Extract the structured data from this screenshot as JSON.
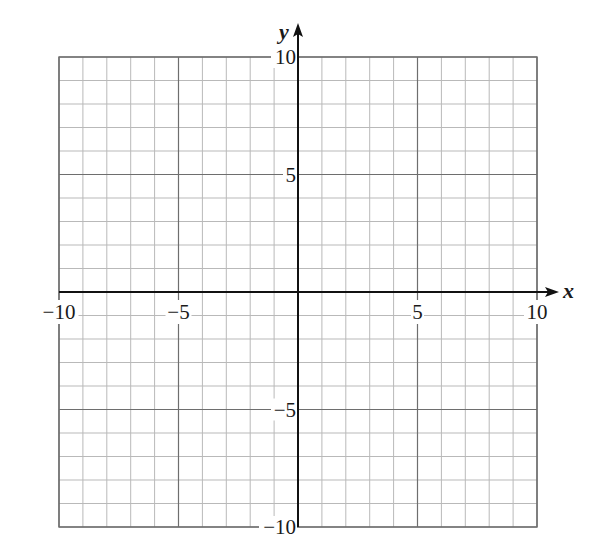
{
  "chart_data": {
    "type": "scatter",
    "title": "",
    "xlabel": "x",
    "ylabel": "y",
    "xlim": [
      -10,
      10
    ],
    "ylim": [
      -10,
      10
    ],
    "grid": true,
    "grid_minor_step": 1,
    "grid_major_step": 5,
    "x_ticks": [
      {
        "value": -10,
        "label": "−10"
      },
      {
        "value": -5,
        "label": "−5"
      },
      {
        "value": 5,
        "label": "5"
      },
      {
        "value": 10,
        "label": "10"
      }
    ],
    "y_ticks": [
      {
        "value": 10,
        "label": "10"
      },
      {
        "value": 5,
        "label": "5"
      },
      {
        "value": -5,
        "label": "−5"
      },
      {
        "value": -10,
        "label": "−10"
      }
    ],
    "series": [],
    "legend": null
  },
  "colors": {
    "background": "#ffffff",
    "minor_grid": "#b9b9b9",
    "major_grid": "#6e6e6e",
    "axis": "#111111",
    "text": "#1a1a1a"
  }
}
